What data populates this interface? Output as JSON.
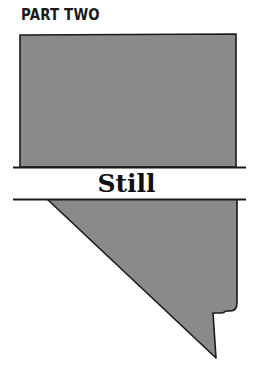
{
  "header": {
    "part_label": "PART TWO"
  },
  "band": {
    "word": "Still"
  },
  "colors": {
    "shape_fill": "#8a8a8a",
    "outline": "#1a1a1a",
    "background": "#ffffff"
  }
}
